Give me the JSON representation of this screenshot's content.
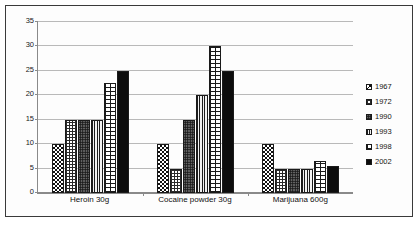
{
  "chart_data": {
    "type": "bar",
    "title": "",
    "xlabel": "",
    "ylabel": "",
    "ylim": [
      0,
      35
    ],
    "yticks": [
      0,
      5,
      10,
      15,
      20,
      25,
      30,
      35
    ],
    "grid": true,
    "legend_position": "right",
    "categories": [
      "Heroin 30g",
      "Cocaine powder 30g",
      "Marijuana 600g"
    ],
    "series": [
      {
        "name": "1967",
        "pattern": "checkerboard",
        "values": [
          10,
          10,
          10
        ]
      },
      {
        "name": "1972",
        "pattern": "fine-grid",
        "values": [
          15,
          5,
          5
        ]
      },
      {
        "name": "1990",
        "pattern": "dense-dots",
        "values": [
          15,
          15,
          5
        ]
      },
      {
        "name": "1993",
        "pattern": "vertical-lines",
        "values": [
          15,
          20,
          5
        ]
      },
      {
        "name": "1998",
        "pattern": "brick",
        "values": [
          22.5,
          30,
          6.5
        ]
      },
      {
        "name": "2002",
        "pattern": "solid-black",
        "values": [
          25,
          25,
          5.5
        ]
      }
    ]
  },
  "legend": {
    "items": [
      {
        "label": "1967"
      },
      {
        "label": "1972"
      },
      {
        "label": "1990"
      },
      {
        "label": "1993"
      },
      {
        "label": "1998"
      },
      {
        "label": "2002"
      }
    ]
  },
  "colors": {
    "frame": "#3a3a3a",
    "axis": "#8a8a8a",
    "gridline": "#b9b9b9",
    "bar_outline": "#1a1a1a",
    "text": "#151515",
    "background": "#ffffff"
  }
}
